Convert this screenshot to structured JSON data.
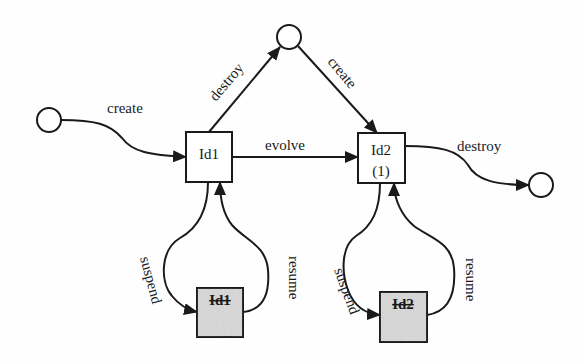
{
  "diagram": {
    "type": "state-transition",
    "colors": {
      "stroke": "#1a1a1a",
      "background": "#fefefe",
      "suspended_fill": "#d9d9d9"
    },
    "states": [
      {
        "id": "initial",
        "kind": "circle",
        "cx": 49,
        "cy": 120,
        "r": 12,
        "label": ""
      },
      {
        "id": "top",
        "kind": "circle",
        "cx": 289,
        "cy": 37,
        "r": 12,
        "label": ""
      },
      {
        "id": "final",
        "kind": "circle",
        "cx": 541,
        "cy": 185,
        "r": 12,
        "label": ""
      },
      {
        "id": "id1",
        "kind": "box",
        "x": 186,
        "y": 132,
        "w": 46,
        "h": 50,
        "label": "Id1",
        "sublabel": ""
      },
      {
        "id": "id2",
        "kind": "box",
        "x": 358,
        "y": 133,
        "w": 47,
        "h": 50,
        "label": "Id2",
        "sublabel": "(1)"
      },
      {
        "id": "id1-suspended",
        "kind": "box-shaded",
        "x": 197,
        "y": 288,
        "w": 46,
        "h": 49,
        "label": "Id1",
        "strikethrough": true
      },
      {
        "id": "id2-suspended",
        "kind": "box-shaded",
        "x": 380,
        "y": 292,
        "w": 47,
        "h": 50,
        "label": "Id2",
        "strikethrough": true
      }
    ],
    "transitions": [
      {
        "id": "create-1",
        "from": "initial",
        "to": "id1",
        "label": "create"
      },
      {
        "id": "destroy-1",
        "from": "id1",
        "to": "top",
        "label": "destroy"
      },
      {
        "id": "create-2",
        "from": "top",
        "to": "id2",
        "label": "create"
      },
      {
        "id": "evolve",
        "from": "id1",
        "to": "id2",
        "label": "evolve"
      },
      {
        "id": "destroy-2",
        "from": "id2",
        "to": "final",
        "label": "destroy"
      },
      {
        "id": "suspend-1",
        "from": "id1",
        "to": "id1-suspended",
        "label": "suspend"
      },
      {
        "id": "resume-1",
        "from": "id1-suspended",
        "to": "id1",
        "label": "resume"
      },
      {
        "id": "suspend-2",
        "from": "id2",
        "to": "id2-suspended",
        "label": "suspend"
      },
      {
        "id": "resume-2",
        "from": "id2-suspended",
        "to": "id2",
        "label": "resume"
      }
    ]
  }
}
